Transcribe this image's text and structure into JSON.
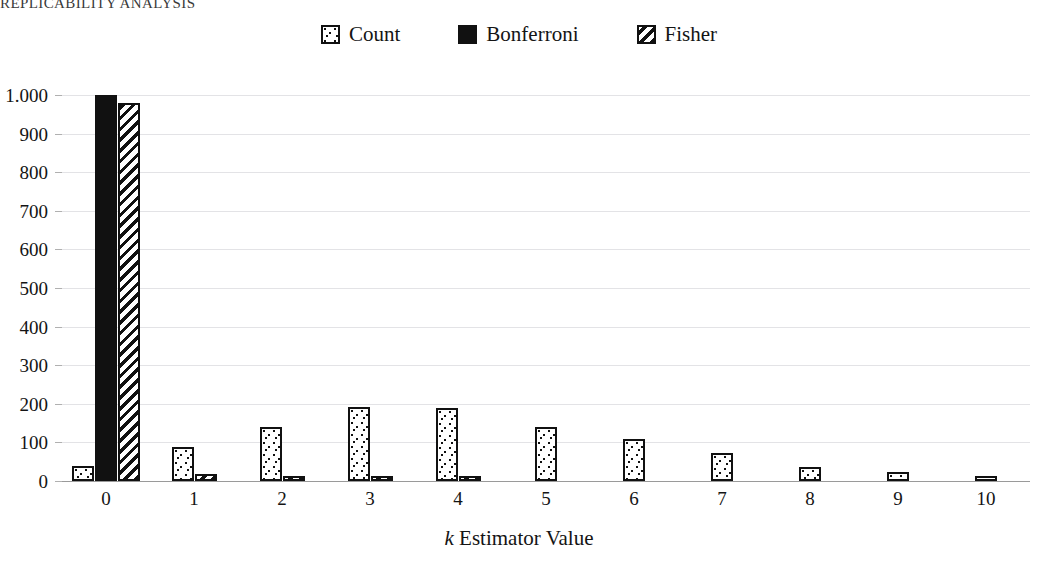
{
  "running_head": "REPLICABILITY ANALYSIS",
  "legend": {
    "items": [
      {
        "label": "Count",
        "pattern": "dots",
        "icon": "dotted-square-icon"
      },
      {
        "label": "Bonferroni",
        "pattern": "solid",
        "icon": "filled-square-icon"
      },
      {
        "label": "Fisher",
        "pattern": "hatch",
        "icon": "hatched-square-icon"
      }
    ]
  },
  "chart_data": {
    "type": "bar",
    "title": "",
    "xlabel": "k Estimator Value",
    "xlabel_italic_prefix": "k",
    "xlabel_rest": " Estimator Value",
    "ylabel": "",
    "categories": [
      "0",
      "1",
      "2",
      "3",
      "4",
      "5",
      "6",
      "7",
      "8",
      "9",
      "10"
    ],
    "ylim": [
      0,
      1000
    ],
    "yticks": [
      0,
      100,
      200,
      300,
      400,
      500,
      600,
      700,
      800,
      900,
      1000
    ],
    "ytick_labels": [
      "0",
      "100",
      "200",
      "300",
      "400",
      "500",
      "600",
      "700",
      "800",
      "900",
      "1.000"
    ],
    "grid": true,
    "legend_position": "top-center",
    "series": [
      {
        "name": "Count",
        "pattern": "dots",
        "values": [
          40,
          88,
          140,
          192,
          188,
          140,
          108,
          72,
          36,
          24,
          13
        ]
      },
      {
        "name": "Bonferroni",
        "pattern": "solid",
        "values": [
          1000,
          0,
          0,
          0,
          0,
          0,
          0,
          0,
          0,
          0,
          0
        ]
      },
      {
        "name": "Fisher",
        "pattern": "hatch",
        "values": [
          980,
          17,
          5,
          5,
          6,
          0,
          0,
          0,
          0,
          0,
          0
        ]
      }
    ]
  }
}
